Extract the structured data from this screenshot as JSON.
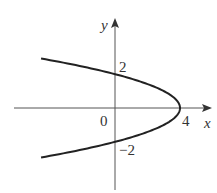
{
  "chart_data": {
    "type": "line",
    "title": "",
    "xlabel": "x",
    "ylabel": "y",
    "equation": "x = 4 - y^2",
    "x": [
      -5.0,
      -4.0,
      -3.0,
      -2.0,
      -1.0,
      0.0,
      1.0,
      2.0,
      3.0,
      3.75,
      4.0,
      3.75,
      3.0,
      2.0,
      1.0,
      0.0,
      -1.0,
      -2.0,
      -3.0,
      -4.0,
      -5.0
    ],
    "y": [
      3.0,
      2.83,
      2.65,
      2.45,
      2.24,
      2.0,
      1.73,
      1.41,
      1.0,
      0.5,
      0.0,
      -0.5,
      -1.0,
      -1.41,
      -1.73,
      -2.0,
      -2.24,
      -2.45,
      -2.65,
      -2.83,
      -3.0
    ],
    "tick_labels": {
      "origin": "0",
      "x": [
        "4"
      ],
      "y": [
        "2",
        "−2"
      ]
    },
    "grid": false,
    "legend": null
  },
  "labels": {
    "x_axis": "x",
    "y_axis": "y",
    "origin": "0",
    "x_tick_4": "4",
    "y_tick_2": "2",
    "y_tick_neg2": "−2"
  }
}
